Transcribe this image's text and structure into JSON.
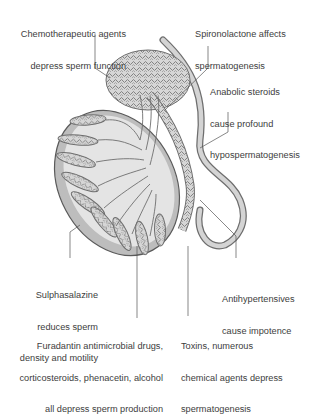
{
  "diagram": {
    "colors": {
      "tubule_stroke": "#6e6e6e",
      "tubule_fill": "#d4d4d4",
      "testis_fill": "#bdbdbd",
      "lobule_fill": "#e6e6e6",
      "vas_fill": "#cfcfcf",
      "leader_line": "#555555",
      "text": "#3d3d3d"
    },
    "labels": [
      {
        "id": "chemotherapeutic",
        "line1": "Chemotherapeutic agents",
        "line2": "depress sperm function"
      },
      {
        "id": "spironolactone",
        "line1": "Spironolactone affects",
        "line2": "spermatogenesis"
      },
      {
        "id": "anabolic",
        "line1": "Anabolic steroids",
        "line2": "cause profound",
        "line3": "hypospermatogenesis"
      },
      {
        "id": "sulphasalazine",
        "line1": "Sulphasalazine",
        "line2": "reduces sperm",
        "line3": "density and motility"
      },
      {
        "id": "antihypertensives",
        "line1": "Antihypertensives",
        "line2": "cause impotence"
      },
      {
        "id": "furadantin",
        "line1": "Furadantin antimicrobial drugs,",
        "line2": "corticosteroids, phenacetin, alcohol",
        "line3": "all depress sperm production"
      },
      {
        "id": "toxins",
        "line1": "Toxins, numerous",
        "line2": "chemical agents depress",
        "line3": "spermatogenesis"
      }
    ]
  }
}
